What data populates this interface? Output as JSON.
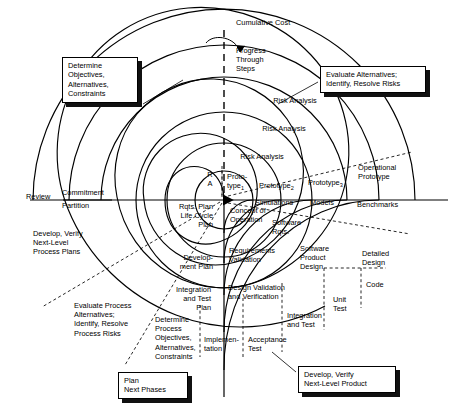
{
  "diagram": {
    "type": "spiral-process-diagram",
    "center": {
      "x": 224,
      "y": 200
    },
    "stroke_color": "#000000",
    "background": "#ffffff"
  },
  "axes": {
    "vertical_label": "Cumulative Cost",
    "progress_label": "Progress\nThrough\nSteps",
    "review_label": "Review",
    "commitment_label": "Commitment",
    "partition_label": "Partition"
  },
  "callouts": [
    {
      "name": "determine-objectives",
      "text": "Determine\nObjectives,\nAlternatives,\nConstraints",
      "x": 62,
      "y": 57,
      "w": 76
    },
    {
      "name": "evaluate-alternatives",
      "text": "Evaluate Alternatives;\nIdentify, Resolve Risks",
      "x": 320,
      "y": 66,
      "w": 106
    },
    {
      "name": "plan-next-phases",
      "text": "Plan\nNext Phases",
      "x": 118,
      "y": 377,
      "w": 70
    },
    {
      "name": "develop-verify-product",
      "text": "Develop, Verify\nNext-Level Product",
      "x": 298,
      "y": 368,
      "w": 98
    }
  ],
  "quadrant_labels": {
    "upper_left": "Determine Objectives, Alternatives, Constraints",
    "upper_right": "Evaluate Alternatives; Identify, Resolve Risks",
    "lower_left": "Plan Next Phases",
    "lower_right": "Develop, Verify Next-Level Product"
  },
  "spiral_labels": [
    {
      "name": "risk-analysis-4",
      "text": "Risk Analysis",
      "x": 264,
      "y": 96
    },
    {
      "name": "risk-analysis-3",
      "text": "Risk Analysis",
      "x": 253,
      "y": 124
    },
    {
      "name": "risk-analysis-2",
      "text": "Risk Analysis",
      "x": 233,
      "y": 152
    },
    {
      "name": "risk-analysis-1",
      "text": "R\nA",
      "x": 208,
      "y": 172
    },
    {
      "name": "prototype-1",
      "text": "Proto-\ntype",
      "sub": "1",
      "x": 229,
      "y": 174
    },
    {
      "name": "prototype-2",
      "text": "Prototype",
      "sub": "2",
      "x": 263,
      "y": 183
    },
    {
      "name": "prototype-3",
      "text": "Prototype",
      "sub": "3",
      "x": 311,
      "y": 180
    },
    {
      "name": "operational-prototype",
      "text": "Operational\nPrototype",
      "x": 358,
      "y": 166
    },
    {
      "name": "simulations",
      "text": "Simulations",
      "x": 262,
      "y": 199
    },
    {
      "name": "models",
      "text": "Models",
      "x": 313,
      "y": 200
    },
    {
      "name": "benchmarks",
      "text": "Benchmarks",
      "x": 358,
      "y": 202
    },
    {
      "name": "concept-of-operation",
      "text": "Concept of\nOperation",
      "x": 226,
      "y": 209
    },
    {
      "name": "software-rqts",
      "text": "Software\nRqts.",
      "x": 270,
      "y": 219
    },
    {
      "name": "requirements-validation",
      "text": "Requirements\nValidation",
      "x": 225,
      "y": 248
    },
    {
      "name": "software-product-design",
      "text": "Software\nProduct\nDesign",
      "x": 299,
      "y": 244
    },
    {
      "name": "detailed-design",
      "text": "Detailed\nDesign",
      "x": 361,
      "y": 249
    },
    {
      "name": "design-validation",
      "text": "Design Validation\nand Verification",
      "x": 222,
      "y": 284
    },
    {
      "name": "code",
      "text": "Code",
      "x": 365,
      "y": 282
    },
    {
      "name": "unit-test",
      "text": "Unit\nTest",
      "x": 337,
      "y": 297
    },
    {
      "name": "integration-and-test",
      "text": "Integration\nand Test",
      "x": 292,
      "y": 314
    },
    {
      "name": "implementation",
      "text": "Implemen-\ntation",
      "x": 212,
      "y": 337
    },
    {
      "name": "acceptance-test",
      "text": "Acceptance\nTest",
      "x": 252,
      "y": 337
    },
    {
      "name": "rqts-plan",
      "text": "Rqts. Plan\nLife Cycle\nPlan",
      "x": 163,
      "y": 205
    },
    {
      "name": "development-plan",
      "text": "Develop-\nment Plan",
      "x": 167,
      "y": 255
    },
    {
      "name": "integration-test-plan",
      "text": "Integration\nand Test\nPlan",
      "x": 163,
      "y": 288
    }
  ],
  "outer_labels": [
    {
      "name": "develop-verify-process-plans",
      "text": "Develop, Verify\nNext-Level\nProcess Plans",
      "x": 33,
      "y": 231
    },
    {
      "name": "evaluate-process-alternatives",
      "text": "Evaluate Process\nAlternatives;\nIdentify, Resolve\nProcess Risks",
      "x": 74,
      "y": 303
    },
    {
      "name": "determine-process-objectives",
      "text": "Determine\nProcess\nObjectives,\nAlternatives,\nConstraints",
      "x": 155,
      "y": 317
    }
  ]
}
